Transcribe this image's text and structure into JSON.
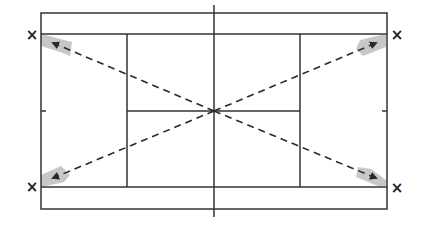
{
  "diagram": {
    "title": "Tennis court cross-court diagonal shots",
    "colors": {
      "line": "#333333",
      "dash": "#2a2a2a",
      "target_zone": "#bdbdbd",
      "background": "#ffffff"
    },
    "court": {
      "outer": {
        "x1": 41,
        "y1": 13,
        "x2": 387,
        "y2": 209
      },
      "singles_top_y": 34,
      "singles_bottom_y": 187,
      "service_left_x": 127,
      "service_right_x": 300,
      "center_service_y": 111,
      "net_x": 214,
      "net_y1": 5,
      "net_y2": 217
    },
    "markers": [
      {
        "id": "x-top-left",
        "label": "×",
        "x": 32,
        "y": 34
      },
      {
        "id": "x-top-right",
        "label": "×",
        "x": 397,
        "y": 35
      },
      {
        "id": "x-bottom-left",
        "label": "×",
        "x": 32,
        "y": 187
      },
      {
        "id": "x-bottom-right",
        "label": "×",
        "x": 397,
        "y": 188
      }
    ],
    "shots": [
      {
        "id": "shot-to-top-left",
        "from": [
          214,
          111
        ],
        "to": [
          51,
          42
        ]
      },
      {
        "id": "shot-to-top-right",
        "from": [
          214,
          111
        ],
        "to": [
          378,
          42
        ]
      },
      {
        "id": "shot-to-bottom-left",
        "from": [
          214,
          111
        ],
        "to": [
          51,
          178
        ]
      },
      {
        "id": "shot-to-bottom-right",
        "from": [
          214,
          111
        ],
        "to": [
          378,
          178
        ]
      }
    ]
  }
}
